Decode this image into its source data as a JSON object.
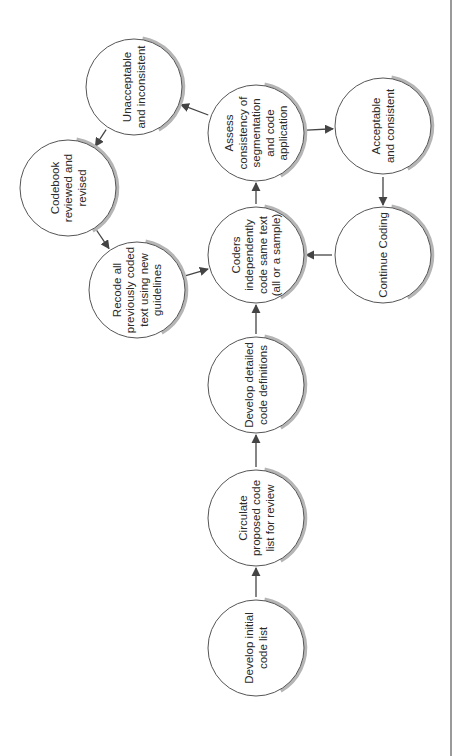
{
  "diagram": {
    "title": "",
    "orientation": "rotated-90-ccw",
    "colors": {
      "node_fill": "#ffffff",
      "node_stroke": "#555555",
      "shadow": "#b5b5b5",
      "edge": "#444444",
      "text": "#2a2a2a"
    },
    "nodes": [
      {
        "id": "initial",
        "lines": [
          "Develop initial",
          "code list"
        ]
      },
      {
        "id": "circulate",
        "lines": [
          "Circulate",
          "proposed code",
          "list for review"
        ]
      },
      {
        "id": "detailed",
        "lines": [
          "Develop detailed",
          "code definitions"
        ]
      },
      {
        "id": "coders",
        "lines": [
          "Coders",
          "independently",
          "code same text",
          "(all or a sample)"
        ]
      },
      {
        "id": "assess",
        "lines": [
          "Assess",
          "consistency of",
          "segmentation",
          "and code",
          "application"
        ]
      },
      {
        "id": "unacceptable",
        "lines": [
          "Unacceptable",
          "and inconsistent"
        ]
      },
      {
        "id": "codebook",
        "lines": [
          "Codebook",
          "reviewed and",
          "revised"
        ]
      },
      {
        "id": "recode",
        "lines": [
          "Recode all",
          "previously coded",
          "text using new",
          "guidelines"
        ]
      },
      {
        "id": "acceptable",
        "lines": [
          "Acceptable",
          "and consistent"
        ]
      },
      {
        "id": "continue",
        "lines": [
          "Continue Coding"
        ]
      }
    ],
    "edges": [
      {
        "from": "initial",
        "to": "circulate"
      },
      {
        "from": "circulate",
        "to": "detailed"
      },
      {
        "from": "detailed",
        "to": "coders"
      },
      {
        "from": "coders",
        "to": "assess"
      },
      {
        "from": "assess",
        "to": "unacceptable"
      },
      {
        "from": "unacceptable",
        "to": "codebook"
      },
      {
        "from": "codebook",
        "to": "recode"
      },
      {
        "from": "recode",
        "to": "coders"
      },
      {
        "from": "assess",
        "to": "acceptable"
      },
      {
        "from": "acceptable",
        "to": "continue"
      },
      {
        "from": "continue",
        "to": "coders"
      }
    ]
  }
}
